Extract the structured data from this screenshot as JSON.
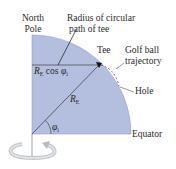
{
  "diagram": {
    "labels": {
      "north_pole_line1": "North",
      "north_pole_line2": "Pole",
      "radius_line1": "Radius of circular",
      "radius_line2": "path of tee",
      "tee": "Tee",
      "golf_ball_line1": "Golf ball",
      "golf_ball_line2": "trajectory",
      "hole": "Hole",
      "equator": "Equator",
      "re_cos_r": "R",
      "re_cos_sub": "E",
      "re_cos_mid": " cos ",
      "re_cos_phi": "φ",
      "re_cos_phi_sub": "i",
      "re_r": "R",
      "re_sub": "E",
      "phi": "φ",
      "phi_sub": "i"
    },
    "colors": {
      "quadrant_fill": "#b4bfe0",
      "quadrant_edge": "#7f8cb8",
      "line": "#333333",
      "arrow": "#c8cccf"
    }
  }
}
